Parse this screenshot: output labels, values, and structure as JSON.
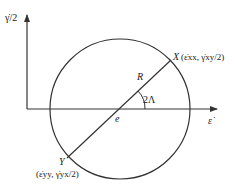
{
  "diagram": {
    "axes": {
      "y_label": "γ̇/2",
      "x_label": "ε̇"
    },
    "circle": {
      "center_label": "e",
      "radius_label": "R",
      "angle_label": "2Λ"
    },
    "points": {
      "X": {
        "name": "X",
        "coords": "(ε̇xx, γ̇xy/2)"
      },
      "Y": {
        "name": "Y",
        "coords": "(ε̇yy, γ̇yx/2)"
      }
    },
    "colors": {
      "stroke": "#333333",
      "text": "#222222"
    }
  }
}
